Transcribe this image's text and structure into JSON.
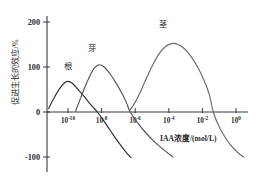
{
  "chart_data": {
    "type": "line",
    "title": "",
    "xlabel": "IAA浓度/(mol/L)",
    "ylabel": "促进生长的效应/%",
    "xscale": "log",
    "xtick_labels": [
      "10⁻¹⁰",
      "10⁻⁸",
      "10⁻⁶",
      "10⁻⁴",
      "10⁻²",
      "10⁰"
    ],
    "xtick_mantissas": [
      "10",
      "10",
      "10",
      "10",
      "10",
      "10"
    ],
    "xtick_exponents": [
      "-10",
      "-8",
      "-6",
      "-4",
      "-2",
      "0"
    ],
    "xtick_exp_values": [
      -10,
      -8,
      -6,
      -4,
      -2,
      0
    ],
    "ytick_labels": [
      "200",
      "100",
      "0",
      "-100"
    ],
    "ytick_values": [
      200,
      100,
      0,
      -100
    ],
    "ylim": [
      -110,
      215
    ],
    "xlim": [
      -11.3,
      1.1
    ],
    "grid": false,
    "legend": "inline-curve-labels",
    "series": [
      {
        "name": "根",
        "label": "根",
        "color": "#2f2f2f",
        "label_x": -10.0,
        "label_y": 95,
        "peak_x": -10.0,
        "peak_y": 68,
        "zero_crossing_x": -8.25,
        "points": [
          {
            "x": -11.15,
            "y": 8
          },
          {
            "x": -10.85,
            "y": 30
          },
          {
            "x": -10.5,
            "y": 52
          },
          {
            "x": -10.2,
            "y": 65
          },
          {
            "x": -10.0,
            "y": 68
          },
          {
            "x": -9.75,
            "y": 64
          },
          {
            "x": -9.4,
            "y": 50
          },
          {
            "x": -9.0,
            "y": 33
          },
          {
            "x": -8.6,
            "y": 14
          },
          {
            "x": -8.25,
            "y": 0
          },
          {
            "x": -7.9,
            "y": -18
          },
          {
            "x": -7.5,
            "y": -40
          },
          {
            "x": -7.1,
            "y": -62
          },
          {
            "x": -6.7,
            "y": -82
          },
          {
            "x": -6.4,
            "y": -96
          },
          {
            "x": -6.25,
            "y": -101
          }
        ]
      },
      {
        "name": "芽",
        "label": "芽",
        "color": "#555555",
        "label_x": -8.55,
        "label_y": 135,
        "peak_x": -8.15,
        "peak_y": 105,
        "zero_crossing_x": -6.3,
        "points": [
          {
            "x": -9.55,
            "y": 2
          },
          {
            "x": -9.3,
            "y": 26
          },
          {
            "x": -9.0,
            "y": 55
          },
          {
            "x": -8.7,
            "y": 80
          },
          {
            "x": -8.45,
            "y": 97
          },
          {
            "x": -8.15,
            "y": 105
          },
          {
            "x": -7.85,
            "y": 100
          },
          {
            "x": -7.5,
            "y": 85
          },
          {
            "x": -7.1,
            "y": 62
          },
          {
            "x": -6.7,
            "y": 35
          },
          {
            "x": -6.45,
            "y": 14
          },
          {
            "x": -6.3,
            "y": 0
          },
          {
            "x": -5.9,
            "y": -22
          },
          {
            "x": -5.4,
            "y": -45
          },
          {
            "x": -4.8,
            "y": -68
          },
          {
            "x": -4.2,
            "y": -87
          },
          {
            "x": -3.75,
            "y": -100
          }
        ]
      },
      {
        "name": "茎",
        "label": "茎",
        "color": "#6a6a6a",
        "label_x": -4.35,
        "label_y": 188,
        "peak_x": -3.85,
        "peak_y": 152,
        "zero_crossing_x": -1.35,
        "points": [
          {
            "x": -6.35,
            "y": 2
          },
          {
            "x": -6.0,
            "y": 22
          },
          {
            "x": -5.65,
            "y": 48
          },
          {
            "x": -5.3,
            "y": 78
          },
          {
            "x": -4.95,
            "y": 105
          },
          {
            "x": -4.6,
            "y": 128
          },
          {
            "x": -4.25,
            "y": 144
          },
          {
            "x": -3.85,
            "y": 152
          },
          {
            "x": -3.45,
            "y": 150
          },
          {
            "x": -3.05,
            "y": 140
          },
          {
            "x": -2.65,
            "y": 122
          },
          {
            "x": -2.25,
            "y": 98
          },
          {
            "x": -1.9,
            "y": 70
          },
          {
            "x": -1.6,
            "y": 40
          },
          {
            "x": -1.35,
            "y": 0
          },
          {
            "x": -1.1,
            "y": -25
          },
          {
            "x": -0.75,
            "y": -50
          },
          {
            "x": -0.35,
            "y": -72
          },
          {
            "x": 0.1,
            "y": -90
          },
          {
            "x": 0.45,
            "y": -100
          }
        ]
      }
    ]
  },
  "axes": {
    "y_axis_name": "y-axis",
    "x_axis_name": "x-axis"
  }
}
